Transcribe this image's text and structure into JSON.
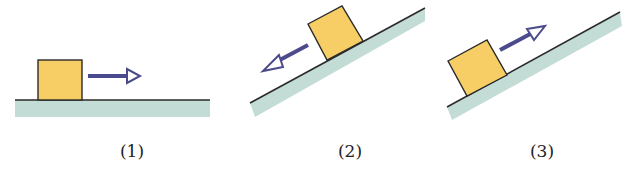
{
  "colors": {
    "block_fill": "#f7cd66",
    "block_stroke": "#2a2a2a",
    "surface_fill": "#c3ddd6",
    "surface_line": "#2a2a2a",
    "arrow": "#4a4a8c",
    "background": "#ffffff"
  },
  "panels": [
    {
      "label": "(1)",
      "surface": "horizontal",
      "arrow_direction": "right",
      "label_x": 132,
      "label_y": 141
    },
    {
      "label": "(2)",
      "surface": "incline",
      "arrow_direction": "down-slope",
      "label_x": 350,
      "label_y": 141
    },
    {
      "label": "(3)",
      "surface": "incline",
      "arrow_direction": "up-slope",
      "label_x": 542,
      "label_y": 141
    }
  ]
}
